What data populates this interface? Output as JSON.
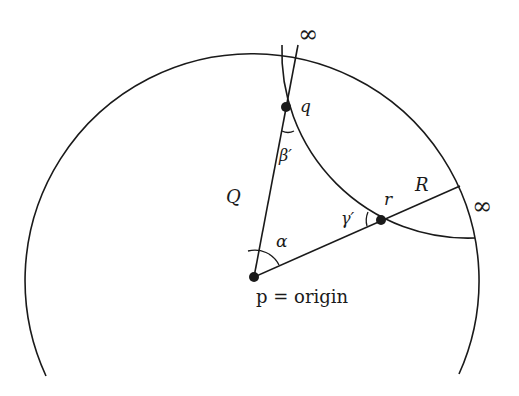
{
  "figure": {
    "labels": {
      "infinity_top": "∞",
      "infinity_right": "∞",
      "q": "q",
      "beta_prime": "β′",
      "Q": "Q",
      "R": "R",
      "r": "r",
      "gamma_prime": "γ′",
      "alpha": "α",
      "p_origin": "p = origin"
    },
    "points": {
      "p": {
        "x": 254,
        "y": 277
      },
      "q": {
        "x": 286,
        "y": 107
      },
      "r": {
        "x": 381,
        "y": 220
      }
    },
    "colors": {
      "stroke": "#1a1a1a",
      "background": "#ffffff"
    }
  }
}
